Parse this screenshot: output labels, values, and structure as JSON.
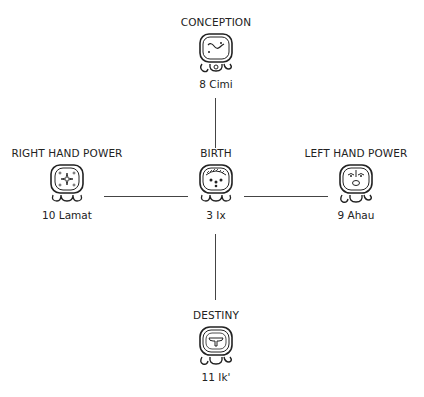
{
  "diagram": {
    "type": "mayan-day-sign-cross",
    "nodes": {
      "top": {
        "title": "CONCEPTION",
        "day": "8 Cimi",
        "glyph": "cimi-glyph"
      },
      "center": {
        "title": "BIRTH",
        "day": "3 Ix",
        "glyph": "ix-glyph"
      },
      "left": {
        "title": "RIGHT HAND POWER",
        "day": "10 Lamat",
        "glyph": "lamat-glyph"
      },
      "right": {
        "title": "LEFT HAND POWER",
        "day": "9 Ahau",
        "glyph": "ahau-glyph"
      },
      "bottom": {
        "title": "DESTINY",
        "day": "11 Ik'",
        "glyph": "ik-glyph"
      }
    },
    "connections": [
      {
        "from": "center",
        "to": "top"
      },
      {
        "from": "center",
        "to": "left"
      },
      {
        "from": "center",
        "to": "right"
      },
      {
        "from": "center",
        "to": "bottom"
      }
    ],
    "colors": {
      "ink": "#222222",
      "background": "#ffffff"
    }
  }
}
